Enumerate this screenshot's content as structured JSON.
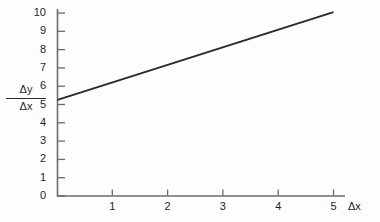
{
  "chart_data": {
    "type": "line",
    "title": "",
    "subtitle": "",
    "xlabel": "Δx",
    "ylabel": "Δy/Δx",
    "ylabel_numerator": "Δy",
    "ylabel_denominator": "Δx",
    "xlim": [
      0,
      5.6
    ],
    "ylim": [
      0,
      10.4
    ],
    "xticks": [
      1,
      2,
      3,
      4,
      5
    ],
    "yticks": [
      0,
      1,
      2,
      3,
      4,
      5,
      6,
      7,
      8,
      9,
      10
    ],
    "xtick_labels": [
      "1",
      "2",
      "3",
      "4",
      "5"
    ],
    "ytick_labels": [
      "0",
      "1",
      "2",
      "3",
      "4",
      "5",
      "6",
      "7",
      "8",
      "9",
      "10"
    ],
    "grid": false,
    "legend": null,
    "series": [
      {
        "name": "slope-line",
        "x": [
          0,
          5
        ],
        "values": [
          5.25,
          10.05
        ],
        "points": [
          {
            "x": 0,
            "y": 5.25
          },
          {
            "x": 1,
            "y": 6.21
          },
          {
            "x": 2,
            "y": 7.17
          },
          {
            "x": 3,
            "y": 8.13
          },
          {
            "x": 4,
            "y": 9.09
          },
          {
            "x": 5,
            "y": 10.05
          }
        ],
        "color": "#2a2a2a",
        "line_width": 2
      }
    ],
    "annotations": [],
    "axis_color": "#6b6b6b",
    "text_color": "#1d1d1d",
    "background_color": "#fdfdfd"
  },
  "axes": {
    "x_axis_name": "delta-x-axis",
    "y_axis_name": "delta-y-over-delta-x-axis"
  }
}
